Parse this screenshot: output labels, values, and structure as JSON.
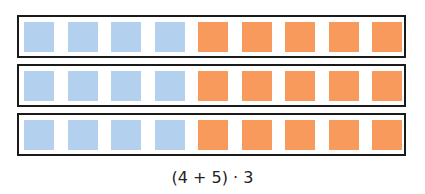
{
  "diagram": {
    "rows": 3,
    "groups": [
      {
        "name": "blue",
        "count": 4,
        "color": "#b3d0ee"
      },
      {
        "name": "orange",
        "count": 5,
        "color": "#f79a5c"
      }
    ],
    "caption": "(4 + 5) · 3"
  }
}
